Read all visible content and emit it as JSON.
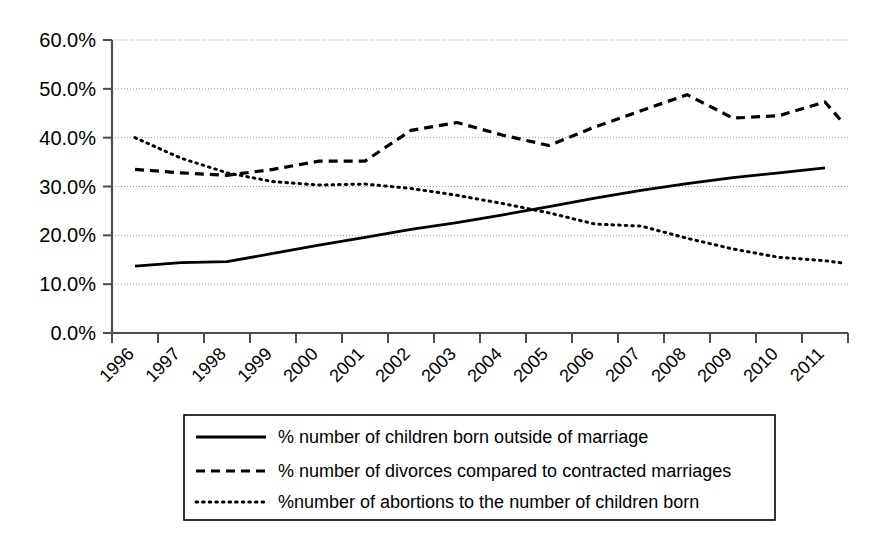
{
  "chart_data": {
    "type": "line",
    "title": "",
    "subtitle": "",
    "xlabel": "",
    "ylabel": "",
    "grid": true,
    "legend_position": "bottom",
    "ylim": [
      0,
      60
    ],
    "ytick_labels": [
      "0.0%",
      "10.0%",
      "20.0%",
      "30.0%",
      "40.0%",
      "50.0%",
      "60.0%"
    ],
    "ytick_values": [
      0,
      10,
      20,
      30,
      40,
      50,
      60
    ],
    "categories": [
      "1996",
      "1997",
      "1998",
      "1999",
      "2000",
      "2001",
      "2002",
      "2003",
      "2004",
      "2005",
      "2006",
      "2007",
      "2008",
      "2009",
      "2010",
      "2011"
    ],
    "series": [
      {
        "name": "% number of children born outside of marriage",
        "style": "solid",
        "color": "#000000",
        "values": [
          13.7,
          14.4,
          14.6,
          16.3,
          18.0,
          19.6,
          21.2,
          22.6,
          24.2,
          25.9,
          27.6,
          29.2,
          30.6,
          31.8,
          32.8,
          33.8
        ]
      },
      {
        "name": "% number of divorces compared to contracted marriages",
        "style": "dashed",
        "color": "#000000",
        "values": [
          33.5,
          32.8,
          32.3,
          33.5,
          35.2,
          35.2,
          41.5,
          43.1,
          40.5,
          38.4,
          42.2,
          45.5,
          48.8,
          44.0,
          44.5,
          47.3
        ]
      },
      {
        "name": "%number of abortions to the number of children born",
        "style": "dotted",
        "color": "#000000",
        "values": [
          40.0,
          35.8,
          32.8,
          31.0,
          30.3,
          30.5,
          29.6,
          28.2,
          26.5,
          24.6,
          22.3,
          21.9,
          19.4,
          17.2,
          15.5,
          14.8
        ]
      }
    ],
    "series_tail": [
      {
        "name": "% number of divorces compared to contracted marriages",
        "final_value": 42.8
      },
      {
        "name": "%number of abortions to the number of children born",
        "final_value": 14.3
      }
    ],
    "legend": [
      {
        "label": "% number of children born outside of marriage",
        "style": "solid"
      },
      {
        "label": "% number of divorces compared to contracted marriages",
        "style": "dashed"
      },
      {
        "label": "%number of abortions to the number of children born",
        "style": "dotted"
      }
    ]
  }
}
